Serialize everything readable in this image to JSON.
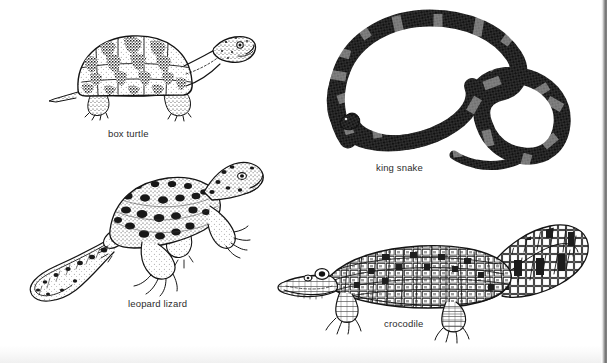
{
  "page": {
    "kind": "illustrated-figure-plate",
    "background_color": "#ffffff",
    "ink_color": "#1a1a1a",
    "caption_color": "#2c2c2c",
    "scan_edge_color": "#6f6f6f",
    "width": 607,
    "height": 363
  },
  "figures": [
    {
      "id": "box-turtle",
      "caption": "box turtle",
      "subject": "box turtle",
      "art_style": "pen-and-ink stipple engraving",
      "position": "top-left",
      "orientation": "facing right",
      "features": "domed carapace with blotched scute pattern, extended head and neck, four scaly legs, short tail"
    },
    {
      "id": "king-snake",
      "caption": "king snake",
      "subject": "king snake",
      "art_style": "pen-and-ink stipple engraving",
      "position": "top-right",
      "orientation": "coiled in an S curve",
      "features": "dark banded body with pale cross bands, blunt head at lower left, tapering tail at lower right"
    },
    {
      "id": "leopard-lizard",
      "caption": "leopard lizard",
      "subject": "leopard lizard",
      "art_style": "pen-and-ink stipple engraving",
      "position": "bottom-left",
      "orientation": "head upper right, tail curving to lower left",
      "features": "heavily spotted back and flanks, four splayed clawed limbs, long slender banded tail"
    },
    {
      "id": "crocodile",
      "caption": "crocodile",
      "subject": "crocodile",
      "art_style": "pen-and-ink stipple engraving",
      "position": "bottom-right",
      "orientation": "facing left",
      "features": "long toothy snout, armoured scute rows along the back, short limbs, thick tail curving up to the right"
    }
  ]
}
